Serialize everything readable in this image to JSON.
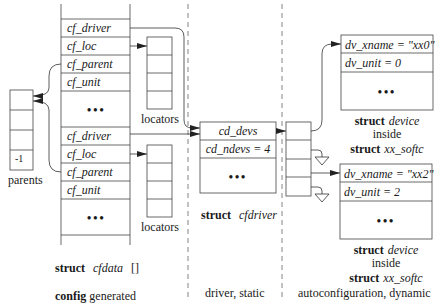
{
  "cfdata": {
    "group1": [
      "cf_driver",
      "cf_loc",
      "cf_parent",
      "cf_unit"
    ],
    "group2": [
      "cf_driver",
      "cf_loc",
      "cf_parent",
      "cf_unit"
    ],
    "ellipsis": "•••",
    "caption_kw": "struct",
    "caption_name": "cfdata",
    "caption_suffix": "[]"
  },
  "locators": {
    "label": "locators"
  },
  "parents": {
    "last_value": "-1",
    "label": "parents"
  },
  "cfdriver": {
    "rows": [
      "cd_devs",
      "cd_ndevs = 4"
    ],
    "ellipsis": "•••",
    "caption_kw": "struct",
    "caption_name": "cfdriver"
  },
  "devices": [
    {
      "xname": "dv_xname = \"xx0\"",
      "unit": "dv_unit = 0",
      "ellipsis": "•••",
      "caption_kw1": "struct",
      "caption_name1": "device",
      "caption_mid": "inside",
      "caption_kw2": "struct",
      "caption_name2": "xx_softc"
    },
    {
      "xname": "dv_xname = \"xx2\"",
      "unit": "dv_unit = 2",
      "ellipsis": "•••",
      "caption_kw1": "struct",
      "caption_name1": "device",
      "caption_mid": "inside",
      "caption_kw2": "struct",
      "caption_name2": "xx_softc"
    }
  ],
  "sections": {
    "config_kw": "config",
    "config_rest": " generated",
    "driver": "driver, static",
    "autoconf": "autoconfiguration, dynamic"
  },
  "colors": {
    "line": "#333333",
    "dash": "#666666",
    "text": "#1a1a1a"
  }
}
